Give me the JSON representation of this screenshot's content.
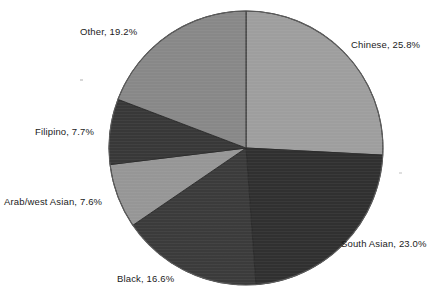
{
  "chart_data": {
    "type": "pie",
    "title": "",
    "subtitle": "",
    "xlabel": "",
    "ylabel": "",
    "legend_position": "none",
    "labels_position": "outside",
    "grid": false,
    "start_angle_deg": 0,
    "direction": "clockwise",
    "unit": "%",
    "categories": [
      "Chinese",
      "South Asian",
      "Black",
      "Arab/west Asian",
      "Filipino",
      "Other"
    ],
    "values": [
      25.8,
      23.0,
      16.6,
      7.6,
      7.7,
      19.2
    ],
    "slices": [
      {
        "name": "Chinese",
        "value": 25.8,
        "label": "Chinese, 25.8%",
        "color": "#9e9e9e"
      },
      {
        "name": "South Asian",
        "value": 23.0,
        "label": "South Asian, 23.0%",
        "color": "#303030"
      },
      {
        "name": "Black",
        "value": 16.6,
        "label": "Black, 16.6%",
        "color": "#3b3b3b"
      },
      {
        "name": "Arab/west Asian",
        "value": 7.6,
        "label": "Arab/west Asian, 7.6%",
        "color": "#969696"
      },
      {
        "name": "Filipino",
        "value": 7.7,
        "label": "Filipino, 7.7%",
        "color": "#383838"
      },
      {
        "name": "Other",
        "value": 19.2,
        "label": "Other, 19.2%",
        "color": "#888888"
      }
    ],
    "geometry": {
      "center_x": 246,
      "center_y": 148,
      "radius": 137
    },
    "style": {
      "outline_color": "#5a5a5a",
      "separator_color": "#2a2a2a",
      "background": "#ffffff",
      "label_color": "#1b1b1b"
    }
  }
}
